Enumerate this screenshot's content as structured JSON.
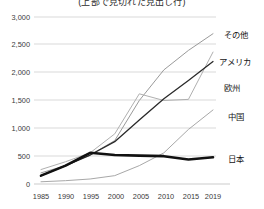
{
  "title": "(上部で見切れた見出し行)",
  "chart_data": {
    "type": "line",
    "title": "",
    "xlabel": "",
    "ylabel": "",
    "ylim": [
      0,
      3000
    ],
    "grid": true,
    "legend_position": "right-inline-labels",
    "categories": [
      "1985",
      "1990",
      "1995",
      "2000",
      "2005",
      "2010",
      "2015",
      "2019"
    ],
    "x_ticks": [
      "1985",
      "1990",
      "1995",
      "2000",
      "2005",
      "2010",
      "2015",
      "2019"
    ],
    "y_ticks": [
      "0",
      "500",
      "1,000",
      "1,500",
      "2,000",
      "2,500",
      "3,000"
    ],
    "y_tick_values": [
      0,
      500,
      1000,
      1500,
      2000,
      2500,
      3000
    ],
    "series": [
      {
        "name": "その他",
        "label": "その他",
        "color": "#9a9a9a",
        "width": 1.0,
        "values": [
          200,
          330,
          520,
          780,
          1500,
          2050,
          2400,
          2700
        ]
      },
      {
        "name": "アメリカ",
        "label": "アメリカ",
        "color": "#b0b0b0",
        "width": 1.0,
        "values": [
          260,
          400,
          560,
          900,
          1620,
          1500,
          1520,
          2370
        ]
      },
      {
        "name": "欧州",
        "label": "欧州",
        "color": "#2a2a2a",
        "width": 1.3,
        "values": [
          150,
          330,
          520,
          760,
          1150,
          1530,
          1860,
          2200
        ]
      },
      {
        "name": "中国",
        "label": "中国",
        "color": "#a8a8a8",
        "width": 1.0,
        "values": [
          40,
          60,
          90,
          150,
          330,
          560,
          980,
          1330
        ]
      },
      {
        "name": "日本",
        "label": "日本",
        "color": "#111111",
        "width": 2.6,
        "values": [
          150,
          330,
          560,
          520,
          510,
          500,
          440,
          480
        ]
      }
    ]
  }
}
